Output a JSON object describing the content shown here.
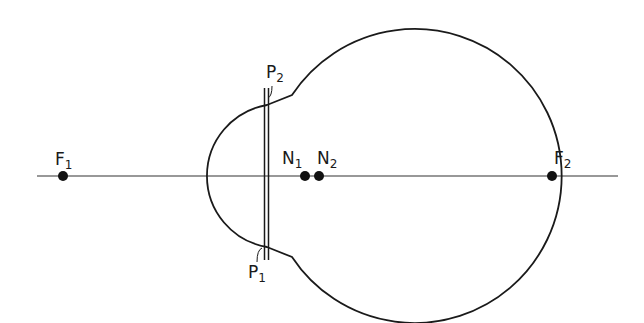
{
  "diagram": {
    "stroke_color": "#1a1a1a",
    "axis_color": "#333333",
    "points": {
      "F1": {
        "letter": "F",
        "sub": "1"
      },
      "F2": {
        "letter": "F",
        "sub": "2"
      },
      "N1": {
        "letter": "N",
        "sub": "1"
      },
      "N2": {
        "letter": "N",
        "sub": "2"
      },
      "P1": {
        "letter": "P",
        "sub": "1"
      },
      "P2": {
        "letter": "P",
        "sub": "2"
      }
    }
  }
}
